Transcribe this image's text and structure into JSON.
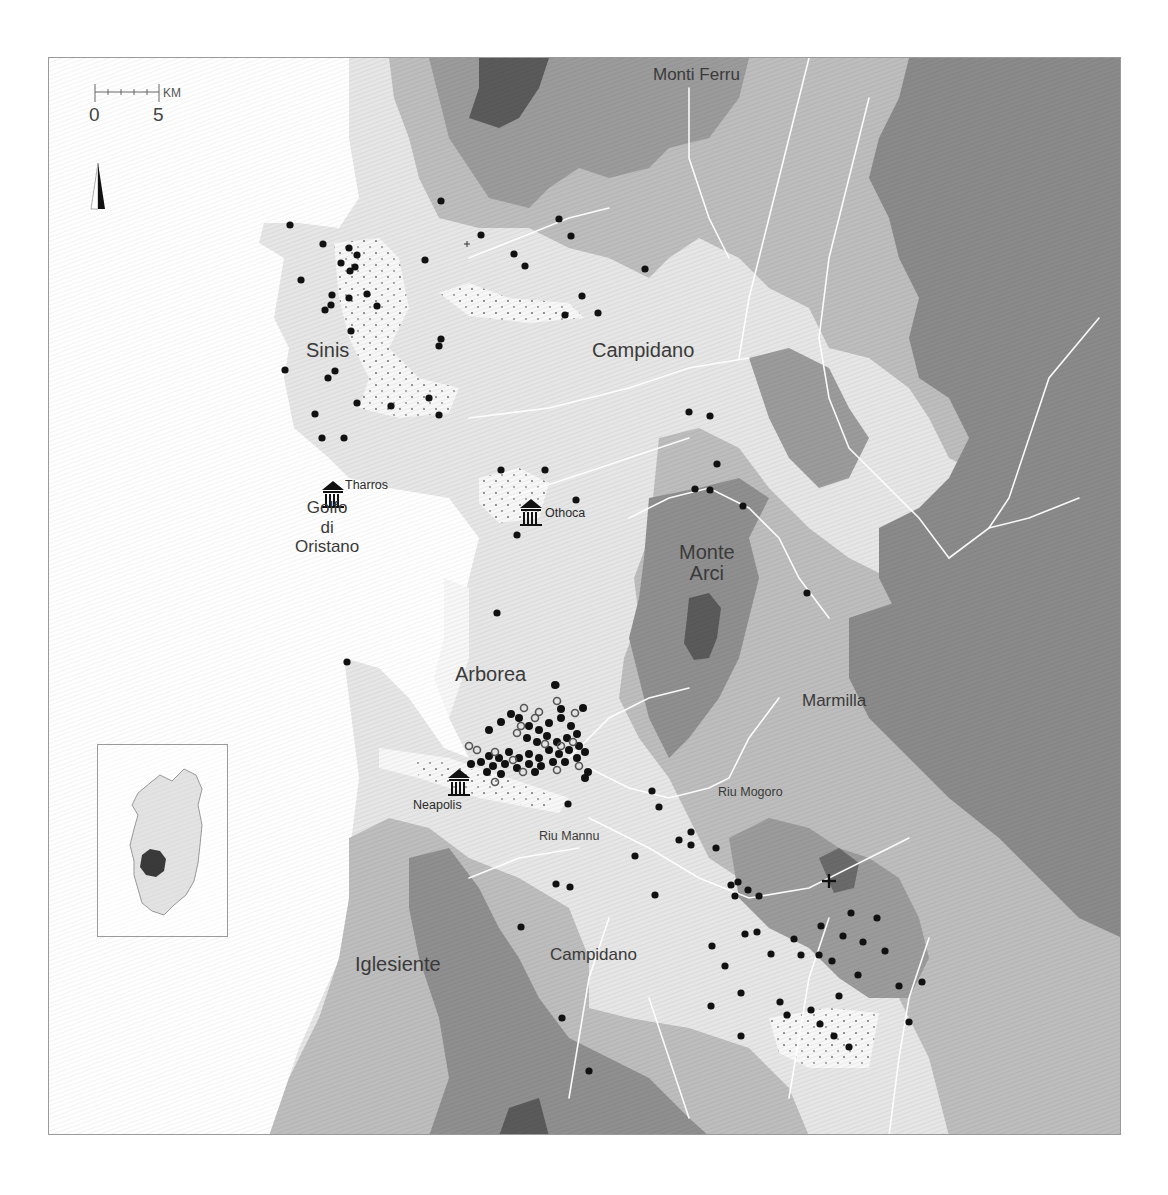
{
  "map": {
    "region_labels": [
      {
        "id": "monti-ferru",
        "text": "Monti Ferru",
        "x": 604,
        "y": 8,
        "size": "md"
      },
      {
        "id": "sinis",
        "text": "Sinis",
        "x": 257,
        "y": 282,
        "size": "lg"
      },
      {
        "id": "campidano-north",
        "text": "Campidano",
        "x": 543,
        "y": 282,
        "size": "lg"
      },
      {
        "id": "golfo-di-oristano",
        "text": "Golfo\ndi\nOristano",
        "x": 254,
        "y": 440,
        "size": "md",
        "multiline": true
      },
      {
        "id": "monte-arci",
        "text": "Monte\nArci",
        "x": 628,
        "y": 484,
        "size": "lg",
        "multiline": true
      },
      {
        "id": "arborea",
        "text": "Arborea",
        "x": 406,
        "y": 606,
        "size": "lg"
      },
      {
        "id": "marmilla",
        "text": "Marmilla",
        "x": 753,
        "y": 634,
        "size": "md"
      },
      {
        "id": "riu-mogoro",
        "text": "Riu Mogoro",
        "x": 669,
        "y": 728,
        "size": "sm"
      },
      {
        "id": "riu-mannu",
        "text": "Riu Mannu",
        "x": 490,
        "y": 772,
        "size": "sm"
      },
      {
        "id": "iglesiente",
        "text": "Iglesiente",
        "x": 306,
        "y": 896,
        "size": "lg"
      },
      {
        "id": "campidano-south",
        "text": "Campidano",
        "x": 501,
        "y": 888,
        "size": "md"
      }
    ],
    "sites": [
      {
        "id": "tharros",
        "name": "Tharros",
        "icon": "temple-icon",
        "x": 284,
        "y": 432
      },
      {
        "id": "othoca",
        "name": "Othoca",
        "icon": "temple-icon",
        "x": 482,
        "y": 450
      },
      {
        "id": "neapolis",
        "name": "Neapolis",
        "icon": "temple-icon",
        "x": 410,
        "y": 720
      }
    ],
    "scale": {
      "unit": "KM",
      "min_label": "0",
      "max_label": "5"
    },
    "north_arrow": "north-arrow-icon",
    "inset": {
      "title": "Sardinia locator",
      "highlight_color": "#3a3a3a"
    },
    "colors": {
      "sea": "#ffffff",
      "lowland": "#e6e6e6",
      "marsh": "#f7f7f7",
      "hill": "#bdbdbd",
      "upland": "#9b9b9b",
      "mountain": "#7b7b7b",
      "peak": "#555555",
      "river": "#ffffff",
      "dot": "#111111"
    },
    "legend": {
      "site_types": [
        "filled-dot",
        "ring-dot",
        "temple-icon",
        "cross-icon",
        "plus-icon"
      ]
    }
  }
}
